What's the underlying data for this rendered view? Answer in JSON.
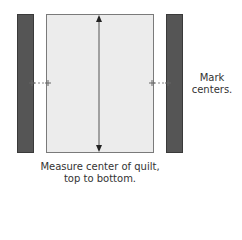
{
  "diagram": {
    "type": "quilt-border-measuring",
    "colors": {
      "border_strip": "#555555",
      "quilt_top": "#ececec",
      "quilt_outline": "#7a7a7a",
      "arrow": "#222222",
      "text": "#333333"
    },
    "elements": {
      "left_border_strip": "border strip (left)",
      "quilt_top": "quilt top",
      "right_border_strip": "border strip (right)",
      "measure_arrow": "vertical double-headed arrow through center of quilt",
      "center_marks": "tick marks at vertical centers"
    },
    "labels": {
      "side_note_line1": "Mark",
      "side_note_line2": "centers.",
      "caption_line1": "Measure center of quilt,",
      "caption_line2": "top to bottom."
    }
  }
}
